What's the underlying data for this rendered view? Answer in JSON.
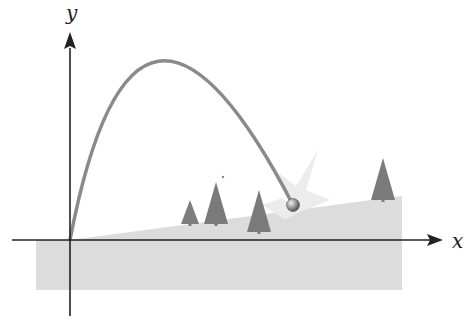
{
  "diagram": {
    "axes": {
      "x_label": "x",
      "y_label": "y"
    },
    "colors": {
      "axis": "#222222",
      "ground": "#d9d9d9",
      "trajectory": "#8a8a8a",
      "tree": "#7a7a7a",
      "burst": "#ececec",
      "ball": "#9a9a9a"
    },
    "elements": {
      "trajectory": "parabolic-path",
      "ball": "projectile-ball",
      "burst": "impact-burst",
      "trees_count": 4,
      "ground": "inclined-plane"
    }
  }
}
